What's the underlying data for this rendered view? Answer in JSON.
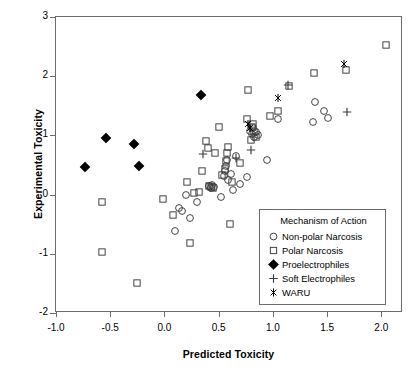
{
  "chart_data": {
    "type": "scatter",
    "title": "",
    "xlabel": "Predicted Toxicity",
    "ylabel": "Experimental Toxicity",
    "xlim": [
      -1.0,
      2.2
    ],
    "ylim": [
      -2.0,
      3.0
    ],
    "xticks": [
      -1.0,
      -0.5,
      0.0,
      0.5,
      1.0,
      1.5,
      2.0
    ],
    "xticklabels": [
      "-1.0",
      "-0.5",
      "0.0",
      "0.5",
      "1.0",
      "1.5",
      "2.0"
    ],
    "yticks": [
      -2,
      -1,
      0,
      1,
      2,
      3
    ],
    "yticklabels": [
      "-2",
      "-1",
      "0",
      "1",
      "2",
      "3"
    ],
    "grid": false,
    "legend_position": "lower right",
    "legend_title": "Mechanism of Action",
    "series": [
      {
        "name": "Non-polar Narcosis",
        "marker": "open-circle",
        "color": "#3a3a3a",
        "points": [
          [
            0.13,
            -0.23
          ],
          [
            0.1,
            -0.62
          ],
          [
            0.16,
            -0.27
          ],
          [
            0.2,
            -0.01
          ],
          [
            0.24,
            -0.39
          ],
          [
            0.3,
            -0.12
          ],
          [
            0.41,
            0.14
          ],
          [
            0.43,
            0.11
          ],
          [
            0.44,
            0.16
          ],
          [
            0.46,
            0.12
          ],
          [
            0.52,
            -0.04
          ],
          [
            0.55,
            0.31
          ],
          [
            0.56,
            0.4
          ],
          [
            0.57,
            0.49
          ],
          [
            0.58,
            0.58
          ],
          [
            0.59,
            0.24
          ],
          [
            0.61,
            0.35
          ],
          [
            0.63,
            0.07
          ],
          [
            0.66,
            0.66
          ],
          [
            0.7,
            0.18
          ],
          [
            0.76,
            0.3
          ],
          [
            0.79,
            1.08
          ],
          [
            0.81,
            1.03
          ],
          [
            0.82,
            1.12
          ],
          [
            0.83,
            0.97
          ],
          [
            0.84,
            1.05
          ],
          [
            0.86,
            1.0
          ],
          [
            0.95,
            0.58
          ],
          [
            1.05,
            1.27
          ],
          [
            1.37,
            1.23
          ],
          [
            1.39,
            1.56
          ],
          [
            1.47,
            1.41
          ],
          [
            1.51,
            1.3
          ]
        ]
      },
      {
        "name": "Polar Narcosis",
        "marker": "open-square",
        "color": "#3a3a3a",
        "points": [
          [
            -0.58,
            -0.13
          ],
          [
            -0.58,
            -0.97
          ],
          [
            -0.25,
            -1.5
          ],
          [
            -0.01,
            -0.07
          ],
          [
            0.08,
            -0.34
          ],
          [
            0.21,
            0.21
          ],
          [
            0.24,
            -0.81
          ],
          [
            0.27,
            0.02
          ],
          [
            0.32,
            0.04
          ],
          [
            0.35,
            0.4
          ],
          [
            0.38,
            0.9
          ],
          [
            0.4,
            0.78
          ],
          [
            0.41,
            0.15
          ],
          [
            0.43,
            0.13
          ],
          [
            0.45,
            0.11
          ],
          [
            0.47,
            0.71
          ],
          [
            0.5,
            1.14
          ],
          [
            0.53,
            0.33
          ],
          [
            0.56,
            0.44
          ],
          [
            0.57,
            0.57
          ],
          [
            0.58,
            0.7
          ],
          [
            0.59,
            0.81
          ],
          [
            0.6,
            -0.5
          ],
          [
            0.62,
            0.22
          ],
          [
            0.7,
            0.53
          ],
          [
            0.76,
            1.27
          ],
          [
            0.77,
            1.76
          ],
          [
            0.8,
            0.92
          ],
          [
            0.81,
            1.14
          ],
          [
            0.82,
            1.2
          ],
          [
            0.83,
            1.06
          ],
          [
            0.84,
            0.97
          ],
          [
            0.97,
            1.32
          ],
          [
            1.05,
            1.42
          ],
          [
            1.15,
            1.83
          ],
          [
            1.38,
            2.05
          ],
          [
            1.67,
            2.1
          ],
          [
            2.04,
            2.52
          ]
        ]
      },
      {
        "name": "Proelectrophiles",
        "marker": "filled-diamond",
        "color": "#000000",
        "points": [
          [
            -0.73,
            0.47
          ],
          [
            -0.54,
            0.96
          ],
          [
            -0.28,
            0.86
          ],
          [
            -0.23,
            0.48
          ],
          [
            0.34,
            1.69
          ]
        ]
      },
      {
        "name": "Soft Electrophiles",
        "marker": "plus",
        "color": "#3a3a3a",
        "points": [
          [
            0.36,
            0.68
          ],
          [
            0.66,
            0.62
          ],
          [
            0.8,
            0.76
          ],
          [
            1.14,
            1.85
          ],
          [
            1.68,
            1.39
          ]
        ]
      },
      {
        "name": "WARU",
        "marker": "asterisk",
        "color": "#000000",
        "points": [
          [
            0.77,
            1.2
          ],
          [
            0.79,
            1.12
          ],
          [
            1.05,
            1.63
          ],
          [
            1.66,
            2.21
          ]
        ]
      }
    ]
  }
}
